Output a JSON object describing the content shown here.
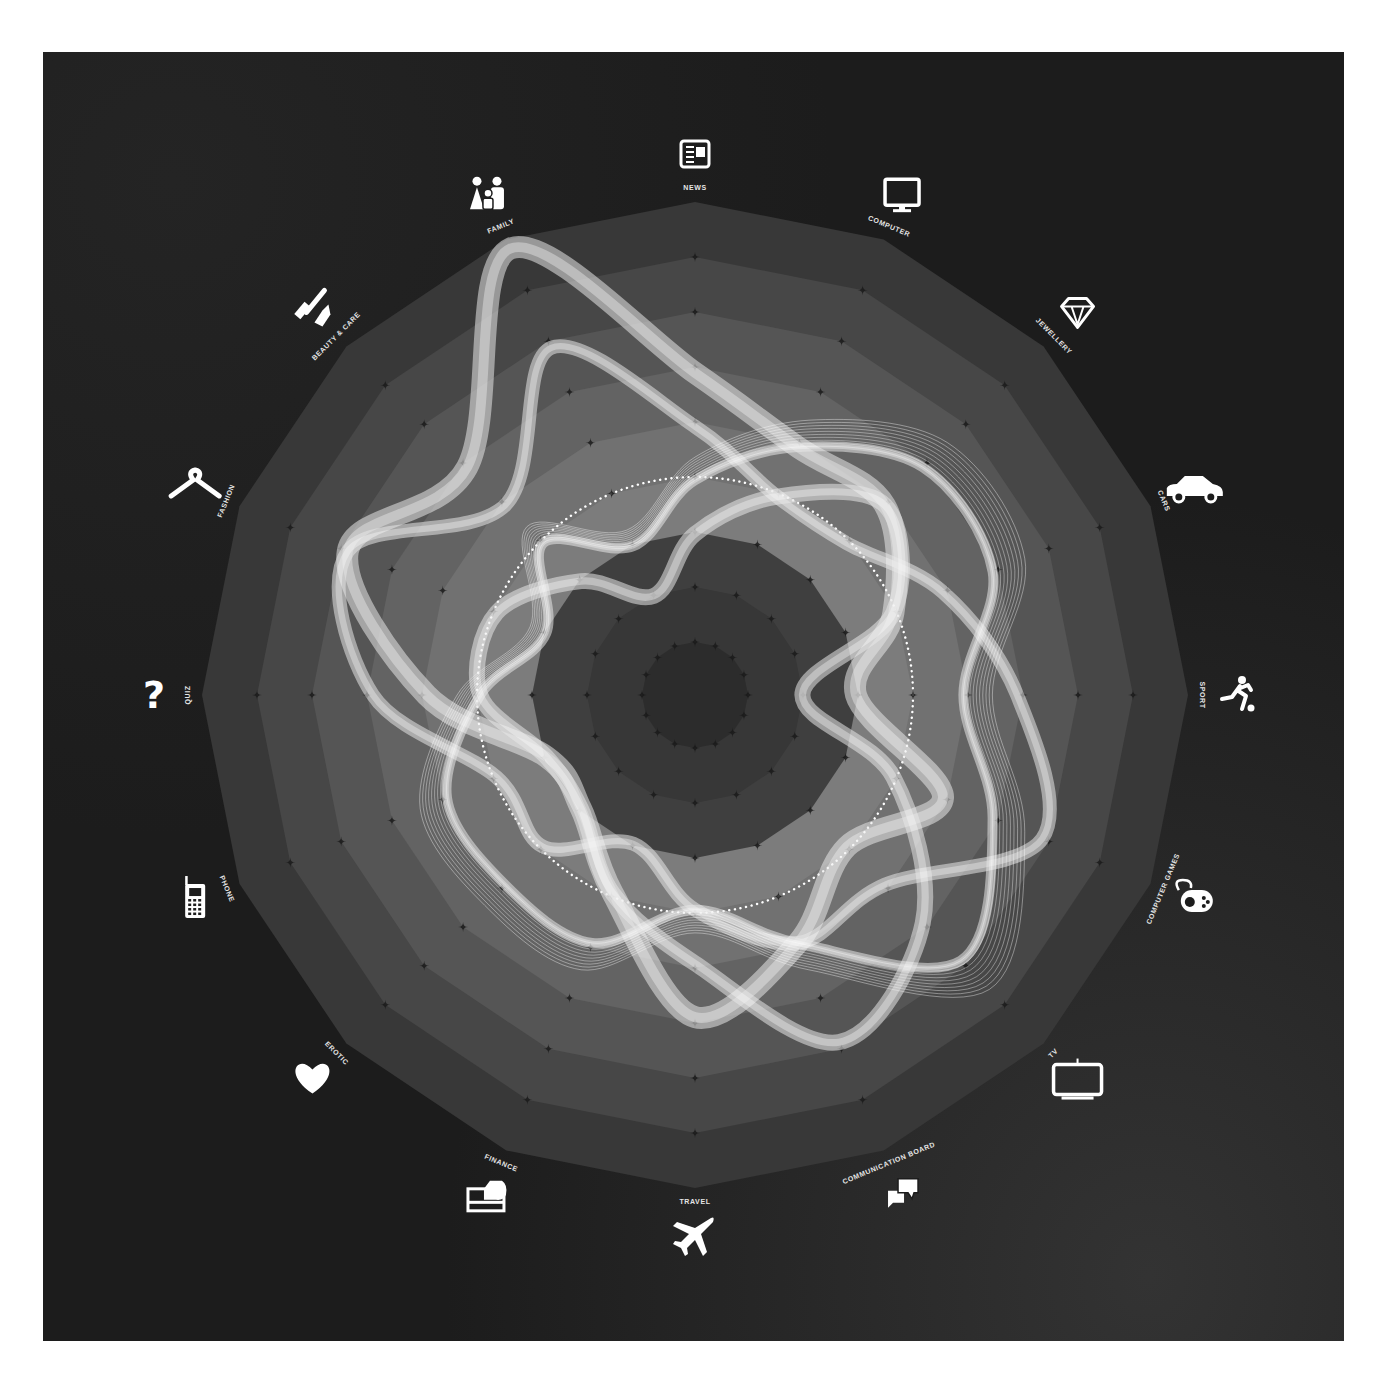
{
  "chart_data": {
    "type": "radar",
    "title": "",
    "categories": [
      "NEWS",
      "COMPUTER",
      "JEWELLERY",
      "CARS",
      "SPORT",
      "COMPUTER GAMES",
      "TV",
      "COMMUNICATION BOARD",
      "TRAVEL",
      "FINANCE",
      "EROTIC",
      "PHONE",
      "QUIZ",
      "FASHION",
      "BEAUTY & CARE",
      "FAMILY"
    ],
    "icons": [
      "newspaper-icon",
      "computer-monitor-icon",
      "diamond-icon",
      "car-icon",
      "soccer-player-icon",
      "gamepad-icon",
      "tv-icon",
      "chat-bubbles-icon",
      "airplane-icon",
      "credit-card-hand-icon",
      "heart-icon",
      "mobile-phone-icon",
      "question-mark-icon",
      "clothes-hanger-icon",
      "razor-lipstick-icon",
      "family-icon"
    ],
    "rings": 9,
    "ring_fill_colors": [
      "#383838",
      "#474747",
      "#555555",
      "#636363",
      "#717171",
      "#7c7c7c",
      "#3f3f3f",
      "#373737",
      "#2c2c2c"
    ],
    "highlight_circle": {
      "ring_index": 4,
      "style": "dotted-white"
    },
    "series": [
      {
        "name": "Ribbon A",
        "values": [
          6,
          5,
          5,
          4,
          3,
          5,
          4,
          5,
          6,
          4,
          3,
          3,
          5,
          7,
          6,
          9
        ]
      },
      {
        "name": "Ribbon B",
        "values": [
          5,
          4,
          4,
          5,
          6,
          7,
          5,
          5,
          4,
          3,
          4,
          4,
          6,
          7,
          5,
          7
        ]
      },
      {
        "name": "Ribbon C",
        "values": [
          4,
          5,
          6,
          6,
          5,
          6,
          7,
          5,
          4,
          5,
          5,
          5,
          4,
          3,
          4,
          3
        ]
      },
      {
        "name": "Ribbon D",
        "values": [
          3,
          4,
          5,
          4,
          2,
          4,
          6,
          7,
          5,
          4,
          3,
          3,
          4,
          4,
          3,
          2
        ]
      }
    ],
    "range": [
      0,
      9
    ],
    "grid": "concentric-polygons-with-star-markers",
    "legend": "none"
  },
  "colors": {
    "background": "#1c1c1c",
    "label": "#e6e6e6",
    "ribbon": "#e8e8e8",
    "marker": "#1a1a1a"
  }
}
